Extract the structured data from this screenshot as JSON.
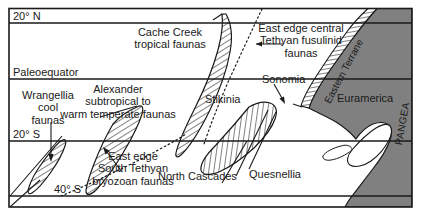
{
  "figure": {
    "kind": "paleogeographic-terrane-map",
    "frame_color": "#1a1a1a",
    "land_color": "#808080",
    "sea_color": "#ffffff",
    "hatch_color": "#1a1a1a"
  },
  "latitude_lines": [
    {
      "id": "lat-20n",
      "label": "20° N",
      "y": 23
    },
    {
      "id": "paleoequator",
      "label": "Paleoequator",
      "y": 79
    },
    {
      "id": "lat-20s",
      "label": "20° S",
      "y": 141
    },
    {
      "id": "lat-40s",
      "label": "40° S",
      "y": 196
    }
  ],
  "terrane_labels": [
    {
      "id": "cache-creek",
      "text": "Cache Creek\ntropical faunas"
    },
    {
      "id": "alexander",
      "text": "Alexander\nsubtropical to\nwarm temperate faunas"
    },
    {
      "id": "wrangellia",
      "text": "Wrangellia\ncool\nfaunas"
    },
    {
      "id": "stikinia",
      "text": "Stikinia"
    },
    {
      "id": "sonomia",
      "text": "Sonomia"
    },
    {
      "id": "quesnellia",
      "text": "Quesnellia"
    },
    {
      "id": "north-cascades",
      "text": "North Cascades"
    },
    {
      "id": "eastern-terrane",
      "text": "Eastern Terrane"
    }
  ],
  "faunal_boundary_labels": [
    {
      "id": "east-edge-central-tethyan",
      "text": "East edge central\nTethyan fusulinid\nfaunas"
    },
    {
      "id": "east-edge-south-tethyan",
      "text": "East edge\nSouth Tethyan\nbryozoan faunas"
    }
  ],
  "continent_labels": [
    {
      "id": "euramerica",
      "text": "Euramerica"
    },
    {
      "id": "pangea",
      "text": "PANGEA"
    }
  ]
}
